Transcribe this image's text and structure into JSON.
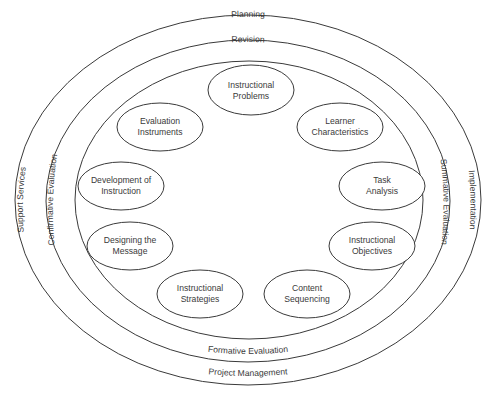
{
  "diagram": {
    "rings": [
      {
        "id": "outer",
        "cx": 248,
        "cy": 200,
        "rx": 233,
        "ry": 185,
        "labels": {
          "top": "Planning",
          "bottom": "Project Management",
          "left": "Support Services",
          "right": "Implementation"
        }
      },
      {
        "id": "middle",
        "cx": 248,
        "cy": 201,
        "rx": 202,
        "ry": 161,
        "labels": {
          "top": "Revision",
          "bottom": "Formative Evaluation",
          "left": "Confirmative Evaluation",
          "right": "Summative Evaluation"
        }
      },
      {
        "id": "inner",
        "cx": 249,
        "cy": 200,
        "rx": 174,
        "ry": 139
      }
    ],
    "nodes": [
      {
        "id": "instructional-problems",
        "line1": "Instructional",
        "line2": "Problems",
        "cx": 251,
        "cy": 90
      },
      {
        "id": "learner-characteristics",
        "line1": "Learner",
        "line2": "Characteristics",
        "cx": 340,
        "cy": 127
      },
      {
        "id": "task-analysis",
        "line1": "Task",
        "line2": "Analysis",
        "cx": 382,
        "cy": 186
      },
      {
        "id": "instructional-objectives",
        "line1": "Instructional",
        "line2": "Objectives",
        "cx": 372,
        "cy": 246
      },
      {
        "id": "content-sequencing",
        "line1": "Content",
        "line2": "Sequencing",
        "cx": 307,
        "cy": 294
      },
      {
        "id": "instructional-strategies",
        "line1": "Instructional",
        "line2": "Strategies",
        "cx": 200,
        "cy": 294
      },
      {
        "id": "designing-the-message",
        "line1": "Designing the",
        "line2": "Message",
        "cx": 130,
        "cy": 246
      },
      {
        "id": "development-of-instruction",
        "line1": "Development of",
        "line2": "Instruction",
        "cx": 121,
        "cy": 186
      },
      {
        "id": "evaluation-instruments",
        "line1": "Evaluation",
        "line2": "Instruments",
        "cx": 160,
        "cy": 127
      }
    ]
  }
}
